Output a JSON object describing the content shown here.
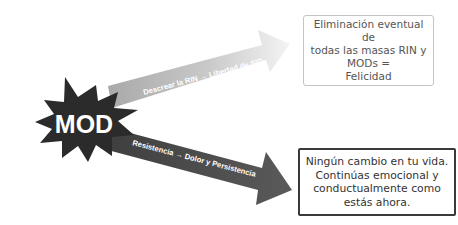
{
  "diagram": {
    "center_node": {
      "label": "MOD",
      "shape": "starburst",
      "color": "#2b2b2b",
      "text_color": "#ffffff"
    },
    "arrows": [
      {
        "id": "upper",
        "label": "Descrear la RIN → Libertad de SID",
        "color": "#bdbdbd",
        "direction": "up-right"
      },
      {
        "id": "lower",
        "label": "Resistencia → Dolor y Persistencia",
        "color": "#4a4a4a",
        "direction": "down-right"
      }
    ],
    "outcomes": [
      {
        "id": "top",
        "text": "Eliminación eventual de\ntodas las masas RIN y\nMODs =\nFelicidad",
        "border_color": "#c4c4c4"
      },
      {
        "id": "bottom",
        "text": "Ningún cambio en tu vida.\nContinúas emocional y\nconductualmente como\nestás ahora.",
        "border_color": "#3a3a3a"
      }
    ]
  }
}
